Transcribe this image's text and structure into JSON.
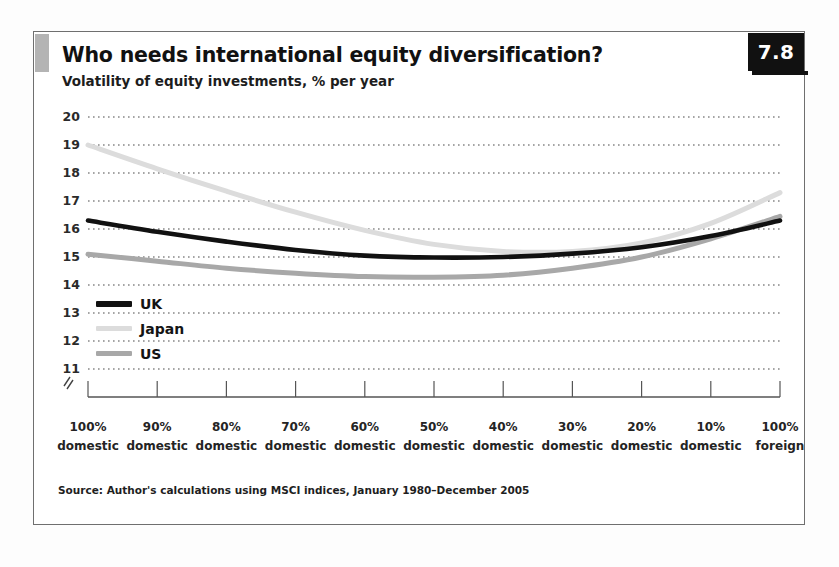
{
  "exhibit": {
    "number": "7.8",
    "title": "Who needs international equity diversification?",
    "subtitle": "Volatility of equity investments, % per year",
    "source": "Source: Author's calculations using MSCI indices, January 1980–December 2005"
  },
  "colors": {
    "uk": "#111111",
    "japan": "#dcdcdc",
    "us": "#a8a8a8",
    "gridline": "#4d4d4d",
    "axis": "#555555",
    "frame": "#6f6f6f",
    "badge_bg": "#111111",
    "badge_text": "#ffffff",
    "accent_bar": "#b4b4b4"
  },
  "chart_data": {
    "type": "line",
    "title": "Who needs international equity diversification?",
    "subtitle": "Volatility of equity investments, % per year",
    "xlabel": "",
    "ylabel": "Volatility, % per year",
    "ylim": [
      11,
      20
    ],
    "yticks": [
      11,
      12,
      13,
      14,
      15,
      16,
      17,
      18,
      19,
      20
    ],
    "ytick_labels": [
      "11",
      "12",
      "13",
      "14",
      "15",
      "16",
      "17",
      "18",
      "19",
      "20"
    ],
    "grid": true,
    "grid_style": "dotted-horizontal",
    "axis_break": true,
    "legend_position": "inside-left",
    "categories": [
      "100% domestic",
      "90% domestic",
      "80% domestic",
      "70% domestic",
      "60% domestic",
      "50% domestic",
      "40% domestic",
      "30% domestic",
      "20% domestic",
      "10% domestic",
      "100% foreign"
    ],
    "xtick_lines": [
      [
        "100%",
        "domestic"
      ],
      [
        "90%",
        "domestic"
      ],
      [
        "80%",
        "domestic"
      ],
      [
        "70%",
        "domestic"
      ],
      [
        "60%",
        "domestic"
      ],
      [
        "50%",
        "domestic"
      ],
      [
        "40%",
        "domestic"
      ],
      [
        "30%",
        "domestic"
      ],
      [
        "20%",
        "domestic"
      ],
      [
        "10%",
        "domestic"
      ],
      [
        "100%",
        "foreign"
      ]
    ],
    "series": [
      {
        "name": "UK",
        "color": "#111111",
        "values": [
          16.3,
          15.9,
          15.55,
          15.25,
          15.05,
          14.98,
          15.0,
          15.12,
          15.35,
          15.75,
          16.3
        ]
      },
      {
        "name": "Japan",
        "color": "#dcdcdc",
        "values": [
          19.0,
          18.15,
          17.35,
          16.6,
          15.95,
          15.45,
          15.2,
          15.2,
          15.5,
          16.2,
          17.3
        ]
      },
      {
        "name": "US",
        "color": "#a8a8a8",
        "values": [
          15.1,
          14.85,
          14.6,
          14.42,
          14.3,
          14.28,
          14.35,
          14.6,
          15.0,
          15.65,
          16.45
        ]
      }
    ]
  },
  "legend": [
    {
      "label": "UK",
      "color": "#111111"
    },
    {
      "label": "Japan",
      "color": "#dcdcdc"
    },
    {
      "label": "US",
      "color": "#a8a8a8"
    }
  ]
}
